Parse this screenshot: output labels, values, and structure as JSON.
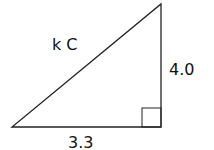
{
  "diagram": {
    "type": "right-triangle",
    "labels": {
      "hypotenuse": "k C",
      "vertical_side": "4.0",
      "horizontal_side": "3.3"
    },
    "right_angle_marker": true,
    "stroke_color": "#222222"
  }
}
